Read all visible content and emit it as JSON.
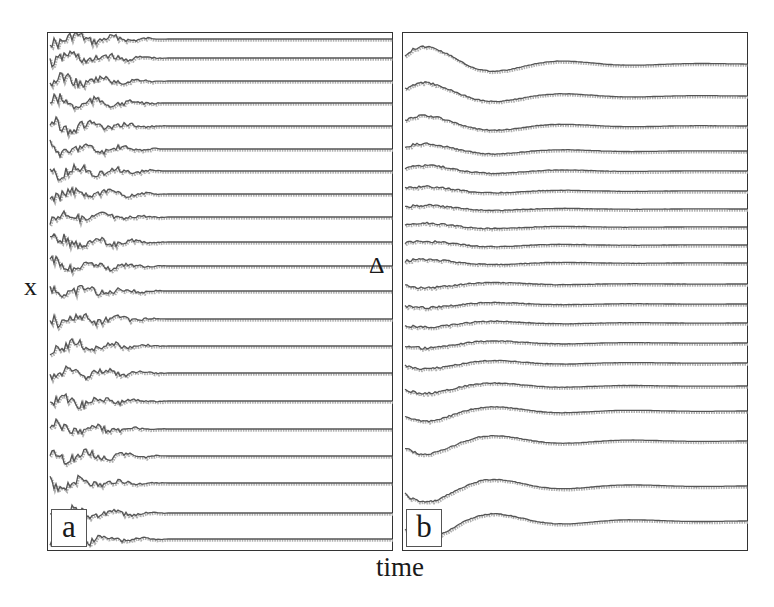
{
  "chart_data": [
    {
      "type": "line",
      "panel_label": "a",
      "title": "",
      "xlabel": "time",
      "ylabel": "x",
      "description": "Stacked time series traces, small irregular oscillations early that quickly settle to flat lines",
      "n_traces": 21,
      "trace_baselines_px": [
        38,
        57,
        80,
        102,
        125,
        148,
        170,
        193,
        216,
        241,
        265,
        290,
        318,
        345,
        372,
        400,
        428,
        455,
        482,
        512,
        538
      ],
      "transient_fraction": 0.35,
      "transient_amplitude_px": 5,
      "grid": false,
      "legend": null
    },
    {
      "type": "line",
      "panel_label": "b",
      "title": "",
      "xlabel": "time",
      "ylabel": "x",
      "description": "Stacked time series traces with large damped oscillations at top and bottom traces, smaller in middle, settling to flat lines",
      "n_traces": 20,
      "trace_baselines_px": [
        63,
        95,
        125,
        150,
        170,
        190,
        208,
        226,
        244,
        262,
        283,
        303,
        322,
        342,
        362,
        385,
        410,
        440,
        485,
        520
      ],
      "transient_fraction": 0.5,
      "transient_amplitude_px": [
        24,
        18,
        14,
        10,
        8,
        6,
        5,
        5,
        5,
        5,
        5,
        5,
        6,
        7,
        8,
        10,
        14,
        18,
        22,
        24
      ],
      "grid": false,
      "legend": null
    }
  ],
  "labels": {
    "panel_a": "a",
    "panel_b": "b",
    "xaxis": "time",
    "yaxis": "x",
    "delta": "Δ"
  },
  "colors": {
    "trace": "#555555",
    "trace_shadow": "#b0b0b0",
    "frame": "#333333"
  }
}
